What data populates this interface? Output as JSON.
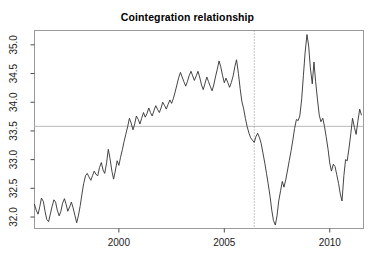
{
  "chart_data": {
    "type": "line",
    "title": "Cointegration relationship",
    "xlabel": "",
    "ylabel": "",
    "xlim": [
      1996.0,
      2011.6
    ],
    "ylim": [
      31.8,
      35.25
    ],
    "grid": false,
    "legend": null,
    "x_ticks": [
      2000,
      2005,
      2010
    ],
    "x_tick_labels": [
      "2000",
      "2005",
      "2010"
    ],
    "y_ticks": [
      32.0,
      32.5,
      33.0,
      33.5,
      34.0,
      34.5,
      35.0
    ],
    "y_tick_labels": [
      "32.0",
      "32.5",
      "33.0",
      "33.5",
      "34.0",
      "34.5",
      "35.0"
    ],
    "annotations": [
      {
        "name": "mean-reference-line",
        "type": "hline",
        "value": 33.58,
        "color": "#b8b8b8"
      },
      {
        "name": "breakpoint-line",
        "type": "vline",
        "value": 2006.42,
        "color": "#8a8a8a",
        "style": "dotted"
      }
    ],
    "series": [
      {
        "name": "cointegration residual",
        "color": "#303030",
        "x": [
          1996.0,
          1996.08,
          1996.17,
          1996.25,
          1996.33,
          1996.42,
          1996.5,
          1996.58,
          1996.67,
          1996.75,
          1996.83,
          1996.92,
          1997.0,
          1997.08,
          1997.17,
          1997.25,
          1997.33,
          1997.42,
          1997.5,
          1997.58,
          1997.67,
          1997.75,
          1997.83,
          1997.92,
          1998.0,
          1998.08,
          1998.17,
          1998.25,
          1998.33,
          1998.42,
          1998.5,
          1998.58,
          1998.67,
          1998.75,
          1998.83,
          1998.92,
          1999.0,
          1999.08,
          1999.17,
          1999.25,
          1999.33,
          1999.42,
          1999.5,
          1999.58,
          1999.67,
          1999.75,
          1999.83,
          1999.92,
          2000.0,
          2000.08,
          2000.17,
          2000.25,
          2000.33,
          2000.42,
          2000.5,
          2000.58,
          2000.67,
          2000.75,
          2000.83,
          2000.92,
          2001.0,
          2001.08,
          2001.17,
          2001.25,
          2001.33,
          2001.42,
          2001.5,
          2001.58,
          2001.67,
          2001.75,
          2001.83,
          2001.92,
          2002.0,
          2002.08,
          2002.17,
          2002.25,
          2002.33,
          2002.42,
          2002.5,
          2002.58,
          2002.67,
          2002.75,
          2002.83,
          2002.92,
          2003.0,
          2003.08,
          2003.17,
          2003.25,
          2003.33,
          2003.42,
          2003.5,
          2003.58,
          2003.67,
          2003.75,
          2003.83,
          2003.92,
          2004.0,
          2004.08,
          2004.17,
          2004.25,
          2004.33,
          2004.42,
          2004.5,
          2004.58,
          2004.67,
          2004.75,
          2004.83,
          2004.92,
          2005.0,
          2005.08,
          2005.17,
          2005.25,
          2005.33,
          2005.42,
          2005.5,
          2005.58,
          2005.67,
          2005.75,
          2005.83,
          2005.92,
          2006.0,
          2006.08,
          2006.17,
          2006.25,
          2006.33,
          2006.42,
          2006.5,
          2006.58,
          2006.67,
          2006.75,
          2006.83,
          2006.92,
          2007.0,
          2007.08,
          2007.17,
          2007.25,
          2007.33,
          2007.42,
          2007.5,
          2007.58,
          2007.67,
          2007.75,
          2007.83,
          2007.92,
          2008.0,
          2008.08,
          2008.17,
          2008.25,
          2008.33,
          2008.42,
          2008.5,
          2008.58,
          2008.67,
          2008.75,
          2008.83,
          2008.92,
          2009.0,
          2009.08,
          2009.17,
          2009.25,
          2009.33,
          2009.42,
          2009.5,
          2009.58,
          2009.67,
          2009.75,
          2009.83,
          2009.92,
          2010.0,
          2010.08,
          2010.17,
          2010.25,
          2010.33,
          2010.42,
          2010.5,
          2010.58,
          2010.67,
          2010.75,
          2010.83,
          2010.92,
          2011.0,
          2011.08,
          2011.17,
          2011.25,
          2011.33,
          2011.42,
          2011.5
        ],
        "y": [
          32.22,
          32.12,
          32.05,
          32.18,
          32.33,
          32.27,
          32.1,
          31.96,
          31.92,
          32.05,
          32.18,
          32.3,
          32.26,
          32.12,
          32.02,
          32.1,
          32.24,
          32.32,
          32.22,
          32.1,
          32.18,
          32.26,
          32.16,
          32.02,
          31.9,
          32.02,
          32.2,
          32.4,
          32.58,
          32.72,
          32.76,
          32.7,
          32.64,
          32.72,
          32.8,
          32.74,
          32.72,
          32.86,
          32.95,
          32.82,
          32.76,
          32.95,
          33.18,
          33.02,
          32.8,
          32.66,
          32.8,
          32.98,
          32.9,
          33.04,
          33.18,
          33.32,
          33.44,
          33.58,
          33.72,
          33.64,
          33.52,
          33.62,
          33.76,
          33.7,
          33.62,
          33.72,
          33.82,
          33.74,
          33.8,
          33.9,
          33.82,
          33.76,
          33.86,
          33.94,
          33.88,
          33.82,
          33.9,
          34.0,
          33.94,
          33.88,
          33.96,
          34.04,
          33.98,
          34.06,
          34.18,
          34.3,
          34.42,
          34.52,
          34.44,
          34.36,
          34.28,
          34.36,
          34.46,
          34.54,
          34.46,
          34.38,
          34.46,
          34.54,
          34.44,
          34.3,
          34.22,
          34.32,
          34.44,
          34.36,
          34.28,
          34.2,
          34.3,
          34.44,
          34.58,
          34.72,
          34.62,
          34.46,
          34.34,
          34.42,
          34.34,
          34.26,
          34.34,
          34.46,
          34.62,
          34.74,
          34.5,
          34.24,
          34.02,
          33.88,
          33.72,
          33.58,
          33.46,
          33.38,
          33.34,
          33.3,
          33.4,
          33.46,
          33.38,
          33.28,
          33.12,
          32.94,
          32.76,
          32.58,
          32.36,
          32.12,
          31.94,
          31.86,
          32.02,
          32.28,
          32.46,
          32.62,
          32.52,
          32.66,
          32.82,
          32.98,
          33.16,
          33.34,
          33.54,
          33.7,
          33.68,
          33.76,
          34.06,
          34.46,
          34.86,
          35.18,
          34.98,
          34.6,
          34.32,
          34.7,
          34.36,
          34.04,
          33.78,
          33.66,
          33.72,
          33.58,
          33.4,
          33.18,
          32.94,
          32.8,
          32.92,
          32.88,
          32.74,
          32.58,
          32.4,
          32.28,
          32.72,
          33.0,
          32.98,
          33.22,
          33.46,
          33.72,
          33.56,
          33.44,
          33.66,
          33.88,
          33.78
        ]
      }
    ]
  }
}
